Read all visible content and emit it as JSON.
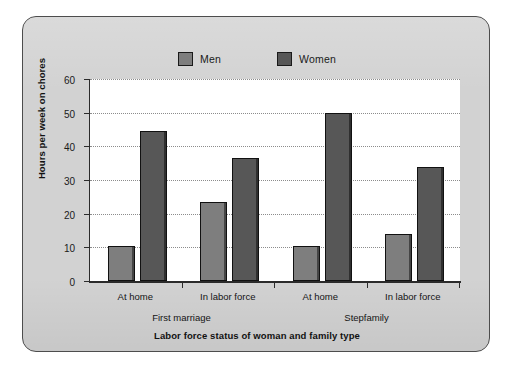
{
  "chart_data": {
    "type": "bar",
    "title": "",
    "xlabel": "Labor force status of woman and family type",
    "ylabel": "Hours per week on chores",
    "ylim": [
      0,
      60
    ],
    "ytick_labels": [
      "0",
      "10",
      "20",
      "30",
      "40",
      "50",
      "60"
    ],
    "ytick_values": [
      0,
      10,
      20,
      30,
      40,
      50,
      60
    ],
    "grid": true,
    "legend_position": "top-center",
    "categories": [
      "At home",
      "In labor force",
      "At home",
      "In labor force"
    ],
    "groups": [
      {
        "name": "First marriage",
        "categories": [
          "At home",
          "In labor force"
        ]
      },
      {
        "name": "Stepfamily",
        "categories": [
          "At home",
          "In labor force"
        ]
      }
    ],
    "series": [
      {
        "name": "Men",
        "color": "#7e7e7e",
        "values": [
          10.5,
          23.5,
          10.5,
          14.0
        ]
      },
      {
        "name": "Women",
        "color": "#575757",
        "values": [
          44.5,
          36.5,
          50.0,
          34.0
        ]
      }
    ]
  },
  "legend": {
    "entries": [
      {
        "label": "Men"
      },
      {
        "label": "Women"
      }
    ]
  },
  "axes": {
    "y_title": "Hours per week on chores",
    "x_title": "Labor force status of woman and family type"
  }
}
